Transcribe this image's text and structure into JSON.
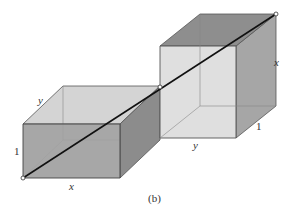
{
  "figure": {
    "caption": "(b)",
    "left_box": {
      "labels": {
        "width": "x",
        "depth": "y",
        "height": "1"
      }
    },
    "right_box": {
      "labels": {
        "height": "x",
        "width": "y",
        "depth": "1"
      }
    },
    "colors": {
      "front_face_dark": "#9a9a9a",
      "side_face": "#8a8a8a",
      "top_face_light": "#d2d2d2",
      "cube_front_light": "#dcdcdc",
      "cube_top_dark": "#8e8e8e",
      "cube_side": "#a8a8a8",
      "edge": "#555555",
      "diagonal": "#111111"
    }
  }
}
